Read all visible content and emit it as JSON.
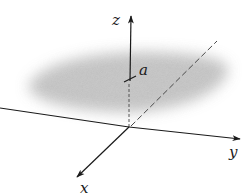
{
  "figure": {
    "type": "3d-coordinate-axes",
    "axes": {
      "x": {
        "label": "x"
      },
      "y": {
        "label": "y"
      },
      "z": {
        "label": "z"
      }
    },
    "plane": {
      "label": "a",
      "equation_hint": "z = a"
    },
    "colors": {
      "axis": "#1a1a1a",
      "plane_fill": "#b8b8b8",
      "dashed_line": "#555555"
    }
  }
}
